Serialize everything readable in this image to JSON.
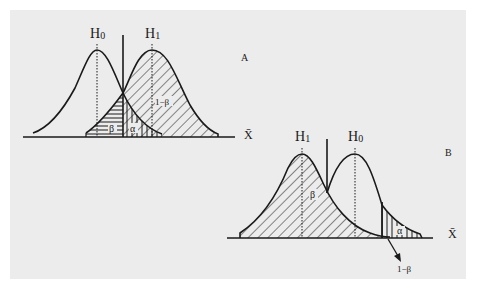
{
  "figure": {
    "background_color": "#ececec",
    "ink_color": "#1a1a1a"
  },
  "panel_a": {
    "panel_label": "A",
    "axis_label": "X̄",
    "null_hypothesis_label": "H",
    "null_hypothesis_sub": "0",
    "alt_hypothesis_label": "H",
    "alt_hypothesis_sub": "1",
    "power_label": "1−β",
    "beta_label": "β",
    "alpha_label": "α"
  },
  "panel_b": {
    "panel_label": "B",
    "axis_label": "X̄",
    "alt_hypothesis_label": "H",
    "alt_hypothesis_sub": "1",
    "null_hypothesis_label": "H",
    "null_hypothesis_sub": "0",
    "beta_label": "β",
    "alpha_label": "α",
    "power_label": "1−β"
  }
}
